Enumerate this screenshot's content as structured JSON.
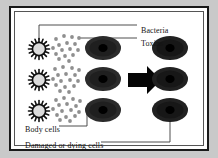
{
  "figure": {
    "background_color": "#c9c9c9",
    "panel_color": "#ffffff",
    "frame_color": "#1a1a1a"
  },
  "labels": {
    "bacteria": "Bacteria",
    "toxins": "Toxins",
    "body_cells": "Body cells",
    "damaged_cells": "Damaged or dying cells"
  },
  "diagram": {
    "type": "process-illustration",
    "arrow_direction": "right",
    "left_group": {
      "rows": 3,
      "bacteria_per_row": 1,
      "bacteria_fill": "#dcdcdc",
      "bacteria_stroke": "#101010",
      "toxin_color": "#8f8f8f",
      "toxins_per_row": 16,
      "cell_fill": "#262626",
      "cell_nucleus_fill": "#000000"
    },
    "right_group": {
      "rows": 3,
      "cell_fill": "#1c1c1c",
      "cell_nucleus_fill": "#000000"
    },
    "leader_lines": {
      "bacteria_to": "top-left bacterium",
      "toxins_to": "toxin dot near top",
      "body_cells_to": "bottom-left body cell",
      "damaged_cells_to": "bottom-right damaged cell"
    }
  }
}
